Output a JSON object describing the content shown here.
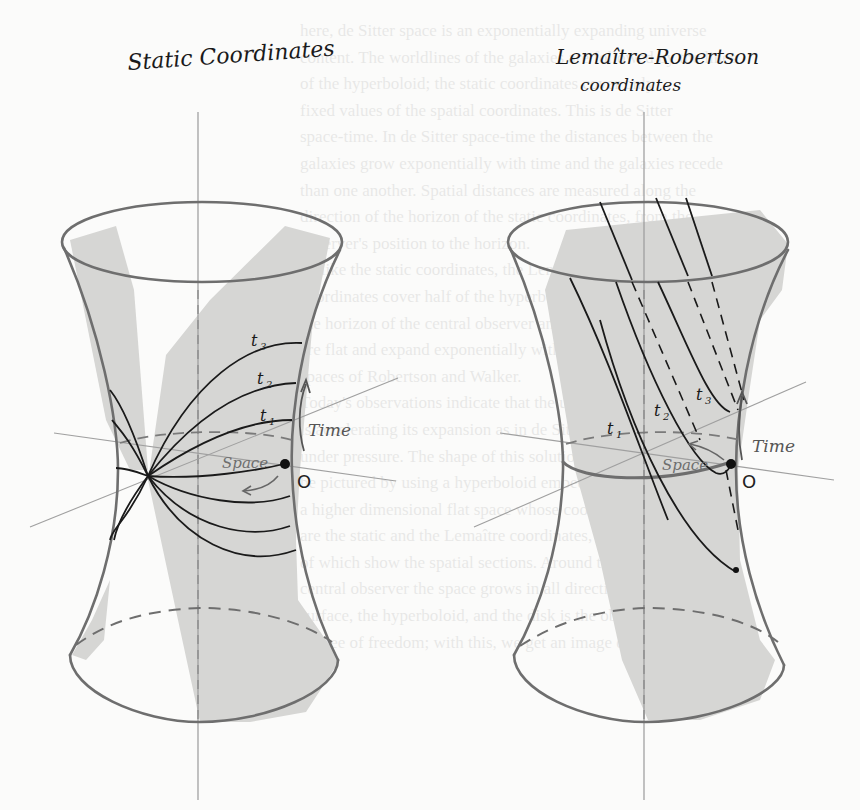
{
  "figure": {
    "left_panel": {
      "title": "Static Coordinates",
      "labels": {
        "t3": "t",
        "t3_sub": "3",
        "t2": "t",
        "t2_sub": "2",
        "t1": "t",
        "t1_sub": "1",
        "time": "Time",
        "space": "Space",
        "origin": "O"
      }
    },
    "right_panel": {
      "title_line1": "Lemaître-Robertson",
      "title_line2": "coordinates",
      "labels": {
        "t3": "t",
        "t3_sub": "3",
        "t2": "t",
        "t2_sub": "2",
        "t1": "t",
        "t1_sub": "1",
        "time": "Time",
        "space": "Space",
        "origin": "O"
      }
    },
    "colors": {
      "paper": "#fbfbfa",
      "shade": "#d6d6d4",
      "outline": "#6e6e6e",
      "ink": "#1a1a1a",
      "axis": "#9a9a9a"
    }
  },
  "bleed_through_text": [
    "here, de Sitter space is an exponentially expanding universe",
    "content. The worldlines of the galaxies are followed by the lines",
    "of the hyperboloid; the static coordinates cover only",
    "fixed values of the spatial coordinates. This is de Sitter",
    "space-time. In de Sitter space-time the distances between the",
    "galaxies grow exponentially with time and the galaxies recede",
    "than one another. Spatial distances are measured along the",
    "direction of the horizon of the static coordinates, from the",
    "observer's position to the horizon.",
    "Unlike the static coordinates, the Lemaître-Robertson",
    "coordinates cover half of the hyperboloid",
    "the horizon of the central observer and the spatial sections",
    "are flat and expand exponentially with time, like the",
    "spaces of Robertson and Walker.",
    "Today's observations indicate that the universe",
    "is accelerating its expansion as in de Sitter's model",
    "under pressure. The shape of this solution can",
    "be pictured by using a hyperboloid embedded in",
    "a higher dimensional flat space whose coordinates",
    "are the static and the Lemaître coordinates, shaped portions",
    "of which show the spatial sections. Around the",
    "central observer the space grows in all directions",
    "surface, the hyperboloid, and the disk is the observer's",
    "degree of freedom; with this, we get an image of an observer"
  ]
}
